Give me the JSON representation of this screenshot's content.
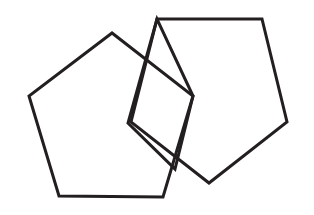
{
  "figure": {
    "background_color": "#ffffff",
    "stroke_color": "#231f20",
    "stroke_width": 3,
    "canvas": {
      "width": 314,
      "height": 215
    },
    "shapes": [
      {
        "id": "left-pentagon",
        "name": "left-pentagon",
        "type": "pentagon",
        "sides": 5,
        "fill": "none",
        "stroke": "#231f20",
        "points": "112,33 29,96 59,196 163,197 193,96"
      },
      {
        "id": "center-square",
        "name": "center-square",
        "type": "square",
        "sides": 4,
        "fill": "none",
        "stroke": "#231f20",
        "points": "157,19 128,123 175,169 193,96"
      },
      {
        "id": "right-pentagon",
        "name": "right-pentagon",
        "type": "pentagon",
        "sides": 5,
        "fill": "none",
        "stroke": "#231f20",
        "points": "157,19 262,19 287,122 209,183 131,122"
      }
    ]
  }
}
